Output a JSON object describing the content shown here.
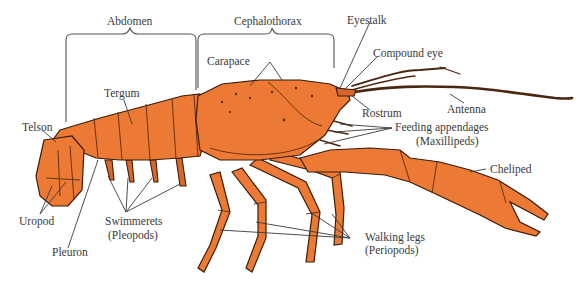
{
  "figure": {
    "colors": {
      "body": "#ec7a34",
      "body_shade": "#d9662a",
      "outline": "#3a1c08",
      "label_text": "#3a3a3a",
      "background": "#ffffff"
    }
  },
  "regions": [
    {
      "id": "abdomen",
      "label": "Abdomen"
    },
    {
      "id": "cephalothorax",
      "label": "Cephalothorax"
    }
  ],
  "labels": {
    "telson": "Telson",
    "tergum": "Tergum",
    "carapace": "Carapace",
    "eyestalk": "Eyestalk",
    "compound_eye": "Compound eye",
    "rostrum": "Rostrum",
    "antenna": "Antenna",
    "feeding_appendages": "Feeding appendages",
    "feeding_appendages_alt": "(Maxillipeds)",
    "cheliped": "Cheliped",
    "walking_legs": "Walking legs",
    "walking_legs_alt": "(Periopods)",
    "swimmerets": "Swimmerets",
    "swimmerets_alt": "(Pleopods)",
    "uropod": "Uropod",
    "pleuron": "Pleuron"
  }
}
